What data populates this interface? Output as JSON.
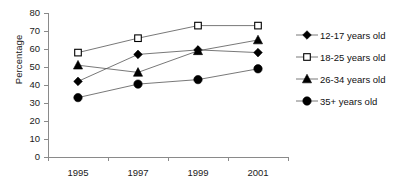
{
  "chart_data": {
    "type": "line",
    "title": "",
    "xlabel": "",
    "ylabel": "Percentage",
    "x": [
      "1995",
      "1997",
      "1999",
      "2001"
    ],
    "categories": [
      "1995",
      "1997",
      "1999",
      "2001"
    ],
    "ylim": [
      0,
      80
    ],
    "ytick_values": [
      0,
      10,
      20,
      30,
      40,
      50,
      60,
      70,
      80
    ],
    "ytick_labels": [
      "0",
      "10",
      "20",
      "30",
      "40",
      "50",
      "60",
      "70",
      "80"
    ],
    "grid": false,
    "legend_position": "right",
    "series": [
      {
        "name": "12-17 years old",
        "marker": "filled-diamond",
        "color": "#000000",
        "values": [
          42,
          57,
          59.5,
          58
        ]
      },
      {
        "name": "18-25 years old",
        "marker": "open-square",
        "color": "#000000",
        "values": [
          58,
          66,
          73,
          73
        ]
      },
      {
        "name": "26-34 years old",
        "marker": "filled-triangle",
        "color": "#000000",
        "values": [
          51,
          47,
          59,
          65
        ]
      },
      {
        "name": "35+ years old",
        "marker": "filled-circle",
        "color": "#000000",
        "values": [
          33,
          40.5,
          43,
          49
        ]
      }
    ]
  },
  "legend": {
    "items": [
      {
        "label": "12-17 years old",
        "marker": "filled-diamond"
      },
      {
        "label": "18-25 years old",
        "marker": "open-square"
      },
      {
        "label": "26-34 years old",
        "marker": "filled-triangle"
      },
      {
        "label": "35+ years old",
        "marker": "filled-circle"
      }
    ]
  },
  "axis": {
    "y_title": "Percentage",
    "y_labels": [
      "80",
      "70",
      "60",
      "50",
      "40",
      "30",
      "20",
      "10",
      "0"
    ],
    "x_labels": [
      "1995",
      "1997",
      "1999",
      "2001"
    ]
  }
}
